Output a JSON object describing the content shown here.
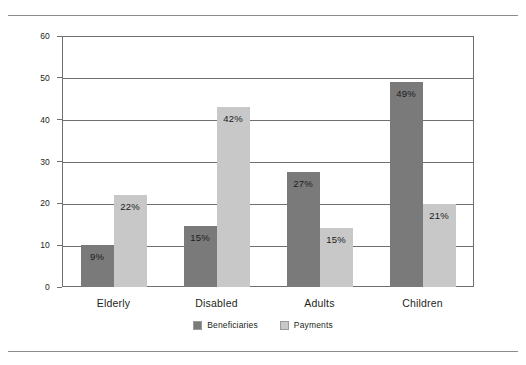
{
  "chart_data": {
    "type": "bar",
    "title": "",
    "xlabel": "",
    "ylabel": "",
    "ylim": [
      0,
      60
    ],
    "yticks": [
      0,
      10,
      20,
      30,
      40,
      50,
      60
    ],
    "grid": true,
    "legend_position": "bottom-center",
    "categories": [
      "Elderly",
      "Disabled",
      "Adults",
      "Children"
    ],
    "series": [
      {
        "name": "Beneficiaries",
        "color": "#7a7a7a",
        "values": [
          9,
          15,
          27,
          49
        ],
        "labels": [
          "9%",
          "15%",
          "27%",
          "49%"
        ],
        "plotted": [
          10.0,
          14.5,
          27.5,
          49.0
        ]
      },
      {
        "name": "Payments",
        "color": "#c8c8c8",
        "values": [
          22,
          42,
          15,
          21
        ],
        "labels": [
          "22%",
          "42%",
          "15%",
          "21%"
        ],
        "plotted": [
          22.0,
          43.0,
          14.0,
          19.8
        ]
      }
    ]
  },
  "legend": {
    "items": [
      {
        "label": "Beneficiaries",
        "color": "#7a7a7a"
      },
      {
        "label": "Payments",
        "color": "#c8c8c8"
      }
    ]
  },
  "axis": {
    "tick_labels": [
      "60",
      "50",
      "40",
      "30",
      "20",
      "10",
      "0"
    ]
  },
  "footer": {
    "source_note": ""
  }
}
